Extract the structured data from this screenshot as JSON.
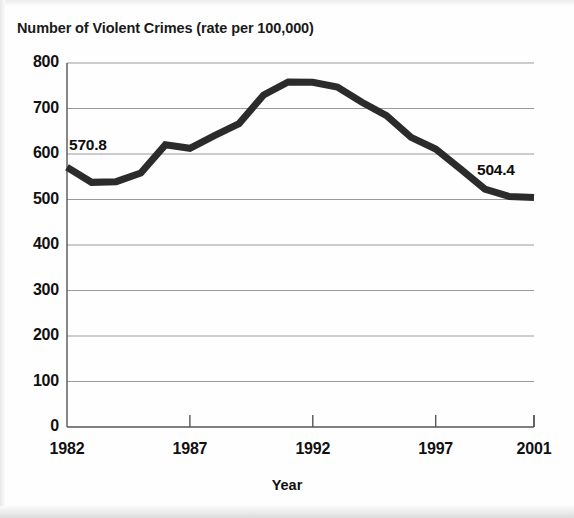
{
  "chart_data": {
    "type": "line",
    "title": "Number of Violent Crimes (rate per 100,000)",
    "xlabel": "Year",
    "ylabel": "",
    "xlim": [
      1982,
      2001
    ],
    "ylim": [
      0,
      800
    ],
    "grid": true,
    "legend": null,
    "x": [
      1982,
      1983,
      1984,
      1985,
      1986,
      1987,
      1988,
      1989,
      1990,
      1991,
      1992,
      1993,
      1994,
      1995,
      1996,
      1997,
      1998,
      1999,
      2000,
      2001
    ],
    "values": [
      570.8,
      537.7,
      539.2,
      558.1,
      620.1,
      612.5,
      640.6,
      666.9,
      729.6,
      758.2,
      757.7,
      747.1,
      713.6,
      684.5,
      636.6,
      611.0,
      567.6,
      523.0,
      506.5,
      504.4
    ],
    "series": [
      {
        "name": "Violent crime rate",
        "values": [
          570.8,
          537.7,
          539.2,
          558.1,
          620.1,
          612.5,
          640.6,
          666.9,
          729.6,
          758.2,
          757.7,
          747.1,
          713.6,
          684.5,
          636.6,
          611.0,
          567.6,
          523.0,
          506.5,
          504.4
        ]
      }
    ],
    "ytick_labels": [
      "800",
      "700",
      "600",
      "500",
      "400",
      "300",
      "200",
      "100",
      "0"
    ],
    "ytick_values": [
      800,
      700,
      600,
      500,
      400,
      300,
      200,
      100,
      0
    ],
    "xtick_labels": [
      "1982",
      "1987",
      "1992",
      "1997",
      "2001"
    ],
    "xtick_values": [
      1982,
      1987,
      1992,
      1997,
      2001
    ],
    "annotations": [
      {
        "text": "570.8",
        "year": 1982,
        "value": 570.8
      },
      {
        "text": "504.4",
        "year": 2001,
        "value": 504.4
      }
    ],
    "colors": {
      "line": "#2b2b2b",
      "grid": "#9a9a9a",
      "axis": "#555555",
      "background": "#ffffff",
      "text": "#111111"
    }
  }
}
